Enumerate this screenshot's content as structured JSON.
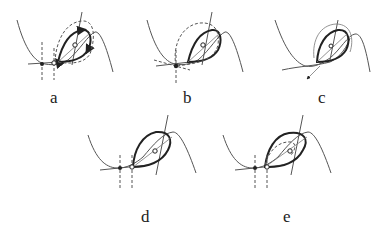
{
  "figure": {
    "panels": [
      {
        "id": "a",
        "label": "a"
      },
      {
        "id": "b",
        "label": "b"
      },
      {
        "id": "c",
        "label": "c"
      },
      {
        "id": "d",
        "label": "d"
      },
      {
        "id": "e",
        "label": "e"
      }
    ],
    "colors": {
      "line": "#555555",
      "loop": "#222222",
      "background": "#ffffff"
    }
  }
}
